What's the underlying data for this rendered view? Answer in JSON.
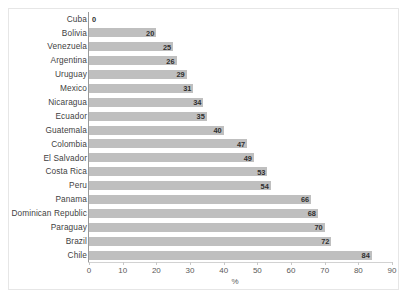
{
  "chart_data": {
    "type": "bar",
    "orientation": "horizontal",
    "title": "",
    "xlabel": "%",
    "ylabel": "",
    "xlim": [
      0,
      90
    ],
    "xticks": [
      0,
      10,
      20,
      30,
      40,
      50,
      60,
      70,
      80,
      90
    ],
    "grid": false,
    "legend": false,
    "bar_color": "#bfbfbf",
    "categories": [
      "Cuba",
      "Bolivia",
      "Venezuela",
      "Argentina",
      "Uruguay",
      "Mexico",
      "Nicaragua",
      "Ecuador",
      "Guatemala",
      "Colombia",
      "El Salvador",
      "Costa Rica",
      "Peru",
      "Panama",
      "Dominican Republic",
      "Paraguay",
      "Brazil",
      "Chile"
    ],
    "values": [
      0,
      20,
      25,
      26,
      29,
      31,
      34,
      35,
      40,
      47,
      49,
      53,
      54,
      66,
      68,
      70,
      72,
      84
    ],
    "data_labels": [
      "0",
      "20",
      "25",
      "26",
      "29",
      "31",
      "34",
      "35",
      "40",
      "47",
      "49",
      "53",
      "54",
      "66",
      "68",
      "70",
      "72",
      "84"
    ]
  }
}
